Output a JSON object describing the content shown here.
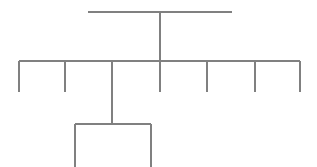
{
  "canvas": {
    "width": 317,
    "height": 167,
    "background_color": "#ffffff"
  },
  "style": {
    "line_color": "#808080",
    "line_width": 1.1,
    "accent_color": "#808080"
  },
  "diagram": {
    "type": "bracket-tree",
    "title": "",
    "labels": [],
    "levels": 3,
    "root": {
      "name": "root-bracket",
      "bar_y": 12,
      "bar_x_start": 88,
      "bar_x_end": 232,
      "stem_x": 160,
      "stem_y_start": 12,
      "stem_y_end": 92
    },
    "level_two": {
      "name": "main-bracket",
      "bar_y": 61,
      "bar_x_start": 19,
      "bar_x_end": 300,
      "leg_y_end": 92,
      "leg_count": 7,
      "leg_positions": [
        19,
        65,
        112,
        160,
        207,
        255,
        300
      ]
    },
    "level_three": {
      "name": "sub-bracket",
      "parent_leg_x": 112,
      "parent_leg_y_end": 124,
      "bar_y": 124,
      "bar_x_start": 75,
      "bar_x_end": 151,
      "leg_y_end": 167,
      "leg_count": 2,
      "leg_positions": [
        75,
        151
      ]
    }
  }
}
